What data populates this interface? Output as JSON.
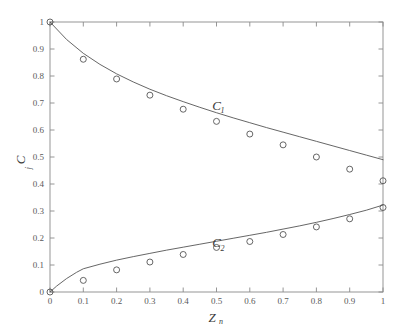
{
  "chart_data": {
    "type": "scatter",
    "title": "",
    "xlabel": "Z_n",
    "xlabel_base": "Z",
    "xlabel_sub": "n",
    "ylabel": "C_j",
    "ylabel_base": "C",
    "ylabel_sub": "j",
    "xlim": [
      0,
      1
    ],
    "ylim": [
      0,
      1
    ],
    "grid": false,
    "legend_position": "inline-annotations",
    "xticks": [
      0,
      0.1,
      0.2,
      0.3,
      0.4,
      0.5,
      0.6,
      0.7,
      0.8,
      0.9,
      1
    ],
    "xticklabels": [
      "0",
      "0.1",
      "0.2",
      "0.3",
      "0.4",
      "0.5",
      "0.6",
      "0.7",
      "0.8",
      "0.9",
      "1"
    ],
    "yticks": [
      0,
      0.1,
      0.2,
      0.3,
      0.4,
      0.5,
      0.6,
      0.7,
      0.8,
      0.9,
      1
    ],
    "yticklabels": [
      "0",
      "0.1",
      "0.2",
      "0.3",
      "0.4",
      "0.5",
      "0.6",
      "0.7",
      "0.8",
      "0.9",
      "1"
    ],
    "annotations": [
      {
        "text": "C",
        "sub": "1",
        "x": 0.5,
        "y": 0.675
      },
      {
        "text": "C",
        "sub": "2",
        "x": 0.5,
        "y": 0.165
      }
    ],
    "series": [
      {
        "name": "C1",
        "label": "C₁",
        "style": "line+markers",
        "marker": "open-circle",
        "color": "#555555",
        "line_x": [
          0,
          0.05,
          0.1,
          0.15,
          0.2,
          0.25,
          0.3,
          0.35,
          0.4,
          0.45,
          0.5,
          0.55,
          0.6,
          0.65,
          0.7,
          0.75,
          0.8,
          0.85,
          0.9,
          0.95,
          1
        ],
        "line_y": [
          1.0,
          0.935,
          0.884,
          0.843,
          0.808,
          0.778,
          0.751,
          0.727,
          0.705,
          0.684,
          0.664,
          0.645,
          0.627,
          0.609,
          0.592,
          0.575,
          0.558,
          0.541,
          0.524,
          0.507,
          0.49
        ],
        "points_x": [
          0,
          0.1,
          0.2,
          0.3,
          0.4,
          0.5,
          0.6,
          0.7,
          0.8,
          0.9,
          1
        ],
        "points_y": [
          1.0,
          0.862,
          0.789,
          0.729,
          0.677,
          0.632,
          0.585,
          0.545,
          0.5,
          0.455,
          0.412
        ]
      },
      {
        "name": "C2",
        "label": "C₂",
        "style": "line+markers",
        "marker": "open-circle",
        "color": "#555555",
        "line_x": [
          0,
          0.02,
          0.05,
          0.08,
          0.1,
          0.15,
          0.2,
          0.25,
          0.3,
          0.35,
          0.4,
          0.45,
          0.5,
          0.55,
          0.6,
          0.65,
          0.7,
          0.75,
          0.8,
          0.85,
          0.9,
          0.95,
          1
        ],
        "line_y": [
          0.0,
          0.022,
          0.05,
          0.073,
          0.086,
          0.103,
          0.118,
          0.131,
          0.143,
          0.155,
          0.166,
          0.177,
          0.188,
          0.199,
          0.21,
          0.221,
          0.233,
          0.245,
          0.258,
          0.272,
          0.287,
          0.303,
          0.322
        ],
        "points_x": [
          0,
          0.1,
          0.2,
          0.3,
          0.4,
          0.5,
          0.6,
          0.7,
          0.8,
          0.9,
          1
        ],
        "points_y": [
          0.0,
          0.043,
          0.082,
          0.111,
          0.139,
          0.165,
          0.187,
          0.213,
          0.241,
          0.271,
          0.313
        ]
      }
    ]
  }
}
